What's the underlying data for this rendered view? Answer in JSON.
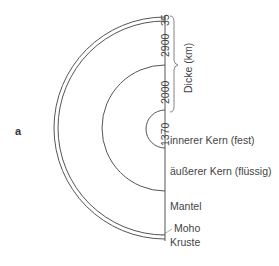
{
  "panel_label": "a",
  "thickness_label": "Dicke (km)",
  "thickness_values": [
    "35",
    "2900",
    "2000",
    "1370"
  ],
  "layers": [
    {
      "name": "innerer Kern (fest)"
    },
    {
      "name": "äußerer Kern (flüssig)"
    },
    {
      "name": "Mantel"
    },
    {
      "name": "Moho"
    },
    {
      "name": "Kruste"
    }
  ],
  "colors": {
    "line": "#555555",
    "text": "#444444"
  }
}
